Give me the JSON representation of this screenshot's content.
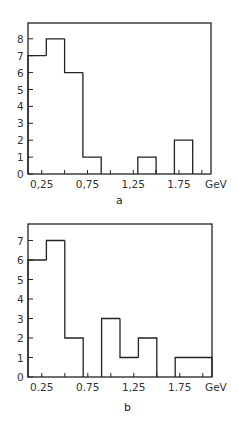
{
  "chart_data": [
    {
      "type": "bar",
      "panel": "a",
      "title": "",
      "caption": "a",
      "xlabel": "GeV",
      "ylabel": "",
      "bin_edges": [
        0.1,
        0.3,
        0.5,
        0.7,
        0.9,
        1.1,
        1.3,
        1.5,
        1.7,
        1.9,
        2.1
      ],
      "categories": [
        "0.1-0.3",
        "0.3-0.5",
        "0.5-0.7",
        "0.7-0.9",
        "0.9-1.1",
        "1.1-1.3",
        "1.3-1.5",
        "1.5-1.7",
        "1.7-1.9",
        "1.9-2.1"
      ],
      "values": [
        7,
        8,
        6,
        1,
        0,
        0,
        1,
        0,
        2,
        0
      ],
      "xticks": [
        "0,25",
        "0,75",
        "1,25",
        "1.75"
      ],
      "xtick_values": [
        0.25,
        0.75,
        1.25,
        1.75
      ],
      "yticks": [
        "0",
        "1",
        "2",
        "3",
        "4",
        "5",
        "6",
        "7",
        "8"
      ],
      "xlim": [
        0.1,
        2.1
      ],
      "ylim": [
        0,
        8.9
      ],
      "grid": false
    },
    {
      "type": "bar",
      "panel": "b",
      "title": "",
      "caption": "b",
      "xlabel": "GeV",
      "ylabel": "",
      "bin_edges": [
        0.1,
        0.3,
        0.5,
        0.7,
        0.9,
        1.1,
        1.3,
        1.5,
        1.7,
        1.9,
        2.1
      ],
      "categories": [
        "0.1-0.3",
        "0.3-0.5",
        "0.5-0.7",
        "0.7-0.9",
        "0.9-1.1",
        "1.1-1.3",
        "1.3-1.5",
        "1.5-1.7",
        "1.7-1.9",
        "1.9-2.1"
      ],
      "values": [
        6,
        7,
        2,
        0,
        3,
        1,
        2,
        0,
        1,
        1
      ],
      "xticks": [
        "0.25",
        "0.75",
        "1,25",
        "1.75"
      ],
      "xtick_values": [
        0.25,
        0.75,
        1.25,
        1.75
      ],
      "yticks": [
        "0",
        "1",
        "2",
        "3",
        "4",
        "5",
        "6",
        "7"
      ],
      "xlim": [
        0.1,
        2.1
      ],
      "ylim": [
        0,
        7.8
      ],
      "grid": false
    }
  ],
  "panels": {
    "a": {
      "caption": "a",
      "unit": "GeV",
      "xticks": [
        "0,25",
        "0,75",
        "1,25",
        "1.75"
      ],
      "yticks": [
        "0",
        "1",
        "2",
        "3",
        "4",
        "5",
        "6",
        "7",
        "8"
      ]
    },
    "b": {
      "caption": "b",
      "unit": "GeV",
      "xticks": [
        "0.25",
        "0.75",
        "1,25",
        "1.75"
      ],
      "yticks": [
        "0",
        "1",
        "2",
        "3",
        "4",
        "5",
        "6",
        "7"
      ]
    }
  },
  "colors": {
    "line": "#222222",
    "background": "#ffffff"
  }
}
